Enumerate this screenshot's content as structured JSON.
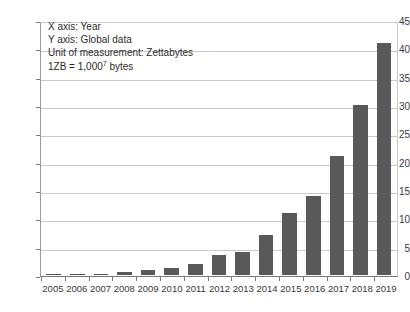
{
  "chart_data": {
    "type": "bar",
    "title": "",
    "xlabel": "Year",
    "ylabel": "Global data",
    "categories": [
      "2005",
      "2006",
      "2007",
      "2008",
      "2009",
      "2010",
      "2011",
      "2012",
      "2013",
      "2014",
      "2015",
      "2016",
      "2017",
      "2018",
      "2019"
    ],
    "values": [
      0.05,
      0.08,
      0.15,
      0.5,
      0.8,
      1.2,
      2,
      3.5,
      4,
      7,
      11,
      14,
      21,
      30,
      41
    ],
    "ylim": [
      0,
      45
    ],
    "ytick_labels": [
      "0",
      "5",
      "10",
      "15",
      "20",
      "25",
      "30",
      "35",
      "40",
      "45"
    ],
    "ytick_values": [
      0,
      5,
      10,
      15,
      20,
      25,
      30,
      35,
      40,
      45
    ],
    "grid": true,
    "legend": "none",
    "series_color": "#595959",
    "gridline_color": "#c9c9c9",
    "axis_color": "#7a7a7a"
  },
  "annotation": {
    "line1": "X axis: Year",
    "line2": "Y axis: Global data",
    "line3": "Unit of measurement: Zettabytes",
    "line4_prefix": "1ZB = 1,000",
    "line4_sup": "7",
    "line4_suffix": " bytes"
  }
}
